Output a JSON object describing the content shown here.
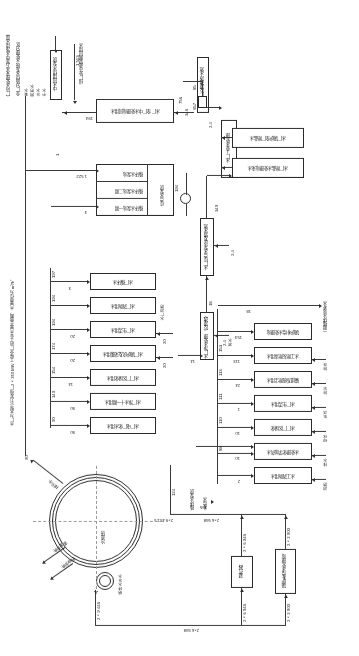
{
  "diagram": {
    "note_right": "水厂为大型火力发电厂2×350 MW 工程全厂的工业水量平衡图，水量单位为 m³/h。",
    "note_bottom_left": "全厂分质供水系统 水处理分区",
    "note_bottom_right": "（厂内水处理来水方案中水净用水量）"
  },
  "top": {
    "boxes": [
      {
        "id": "demin",
        "label": "锅炉补给水处理站",
        "x": 63,
        "y": 62,
        "w": 21,
        "h": 45
      },
      {
        "id": "cond",
        "label": "凝汽器",
        "x": 106,
        "y": 68,
        "w": 22,
        "h": 32
      }
    ],
    "flow_labels": [
      {
        "text": "2×2 900",
        "x": 70,
        "y": 30
      },
      {
        "text": "2×2 900",
        "x": 70,
        "y": 118
      },
      {
        "text": "2×6 948",
        "x": 113,
        "y": 32
      },
      {
        "text": "2×6 948",
        "x": 113,
        "y": 113
      },
      {
        "text": "2×6 948",
        "x": 160,
        "y": 42
      },
      {
        "text": "2×6 948",
        "x": 160,
        "y": 141
      },
      {
        "text": "2×9 451.5",
        "x": 185,
        "y": 135
      },
      {
        "text": "2×9 448",
        "x": 248,
        "y": 46
      },
      {
        "text": "105",
        "x": 160,
        "y": 146
      },
      {
        "text": "124",
        "x": 178,
        "y": 168
      }
    ],
    "side_labels": [
      {
        "text": "循环水泵房",
        "x": 163,
        "y": 150
      },
      {
        "text": "补给水",
        "x": 148,
        "y": 152
      },
      {
        "text": "循环水补水",
        "x": 234,
        "y": 70
      },
      {
        "text": "冷却塔",
        "x": 256,
        "y": 122
      },
      {
        "text": "风吹损失",
        "x": 286,
        "y": 86
      },
      {
        "text": "蒸发损失",
        "x": 299,
        "y": 95
      },
      {
        "text": "排污水",
        "x": 316,
        "y": 168
      },
      {
        "text": "90",
        "x": 314,
        "y": 175
      }
    ]
  },
  "left_column": {
    "boxes": [
      {
        "label": "水工消防用水",
        "qty": "2",
        "tap": "消防",
        "tapqty": "2",
        "x": 47,
        "y": 172,
        "w": 58,
        "h": 17
      },
      {
        "label": "水处理化学加药水",
        "qty": "10",
        "tap": "排水",
        "tapqty": "10",
        "x": 47,
        "y": 196,
        "w": 58,
        "h": 17
      },
      {
        "label": "水厂厂区绿化",
        "qty": "10",
        "tap": "绿化",
        "tapqty": "10",
        "x": 47,
        "y": 220,
        "w": 58,
        "h": 17
      },
      {
        "label": "水厂生活用水",
        "qty": "1",
        "tap": "生活",
        "tapqty": "1",
        "x": 47,
        "y": 244,
        "w": 58,
        "h": 17
      },
      {
        "label": "输煤系统除尘用水",
        "qty": "24",
        "tap": "除尘",
        "tapqty": "24",
        "x": 47,
        "y": 268,
        "w": 58,
        "h": 17
      },
      {
        "label": "水工除灰除渣用水",
        "qty": "113",
        "tap": "除灰",
        "tapqty": "113",
        "x": 47,
        "y": 292,
        "w": 58,
        "h": 17
      },
      {
        "label": "锅炉补给水处理站",
        "qty": "153",
        "tap": "",
        "tapqty": "",
        "x": 47,
        "y": 316,
        "w": 58,
        "h": 17
      }
    ],
    "riser_values": [
      "2",
      "10",
      "88",
      "110",
      "111",
      "113",
      "153",
      "18"
    ],
    "side_labels": [
      {
        "text": "一期循环水站补水",
        "x": 36,
        "y": 330
      },
      {
        "text": "18",
        "x": 108,
        "y": 352
      }
    ]
  },
  "mid": {
    "boxes": [
      {
        "label": "水厂净水处理（反渗透）",
        "x": 145,
        "y": 296,
        "w": 14,
        "h": 46
      },
      {
        "label": "水厂综合水泵房及清水池",
        "x": 145,
        "y": 380,
        "w": 14,
        "h": 58
      },
      {
        "label": "水厂工业水处理",
        "x": 122,
        "y": 480,
        "w": 16,
        "h": 58
      },
      {
        "label": "水厂反渗透浓水池",
        "x": 150,
        "y": 543,
        "w": 12,
        "h": 56
      }
    ],
    "labels": [
      {
        "text": "14",
        "x": 169,
        "y": 294
      },
      {
        "text": "2.4",
        "x": 136,
        "y": 318
      },
      {
        "text": "浓水",
        "x": 129,
        "y": 316
      },
      {
        "text": "18",
        "x": 164,
        "y": 354
      },
      {
        "text": "2.4",
        "x": 122,
        "y": 412
      },
      {
        "text": "349",
        "x": 139,
        "y": 448
      },
      {
        "text": "2.4",
        "x": 178,
        "y": 440
      },
      {
        "text": "346",
        "x": 148,
        "y": 533
      },
      {
        "text": "756",
        "x": 172,
        "y": 546
      },
      {
        "text": "657",
        "x": 176,
        "y": 558
      },
      {
        "text": "85",
        "x": 158,
        "y": 552
      },
      {
        "text": "85",
        "x": 160,
        "y": 570
      },
      {
        "text": "267",
        "x": 186,
        "y": 470
      },
      {
        "text": "1 020",
        "x": 262,
        "y": 545
      },
      {
        "text": "405",
        "x": 300,
        "y": 520
      },
      {
        "text": "194",
        "x": 274,
        "y": 490
      },
      {
        "text": "1",
        "x": 262,
        "y": 500
      },
      {
        "text": "3",
        "x": 278,
        "y": 600
      },
      {
        "text": "1 522",
        "x": 302,
        "y": 610
      },
      {
        "text": "1 513",
        "x": 302,
        "y": 565
      }
    ]
  },
  "right_column": {
    "boxes": [
      {
        "label": "水厂电厂化水用水",
        "qty": "90",
        "cum": "90",
        "x": 203,
        "y": 222,
        "w": 66,
        "h": 17
      },
      {
        "label": "水厂净水十一期用水",
        "qty": "90",
        "cum": "140",
        "x": 203,
        "y": 246,
        "w": 66,
        "h": 17
      },
      {
        "label": "水厂厂区绿化用水",
        "qty": "14",
        "cum": "154",
        "x": 203,
        "y": 270,
        "w": 66,
        "h": 17
      },
      {
        "label": "水厂锅炉房及采暖用水",
        "qty": "20",
        "cum": "174",
        "x": 203,
        "y": 294,
        "w": 66,
        "h": 17
      },
      {
        "label": "水厂生活用水",
        "qty": "20",
        "cum": "194",
        "x": 203,
        "y": 318,
        "w": 66,
        "h": 17
      },
      {
        "label": "水厂消防用水",
        "qty": "",
        "cum": "194",
        "x": 203,
        "y": 342,
        "w": 66,
        "h": 17
      },
      {
        "label": "水厂循环水",
        "qty": "3",
        "cum": "197",
        "x": 203,
        "y": 366,
        "w": 66,
        "h": 17
      }
    ],
    "side_taps": [
      {
        "text": "水厂消防",
        "x": 196,
        "y": 340
      },
      {
        "text": "20",
        "x": 193,
        "y": 296
      },
      {
        "text": "20",
        "x": 193,
        "y": 320
      }
    ]
  },
  "bottom": {
    "boxes": [
      {
        "label": "水厂除盐水处理站来水",
        "x": 55,
        "y": 478,
        "w": 72,
        "h": 20
      },
      {
        "label": "水厂锅炉全厂除盐水",
        "x": 55,
        "y": 508,
        "w": 72,
        "h": 20
      },
      {
        "label": "水厂全厂中水处理站回用水",
        "x": 185,
        "y": 533,
        "w": 72,
        "h": 24
      },
      {
        "label": "中水回用供水泵房",
        "x": 297,
        "y": 560,
        "w": 12,
        "h": 46
      }
    ],
    "group": {
      "title": "综合\n水泵房",
      "rows": [
        {
          "label": "循环水泵站一期",
          "qty": "194"
        },
        {
          "label": "循环水泵站二期",
          "qty": ""
        },
        {
          "label": "循环水泵站",
          "qty": "1"
        }
      ],
      "x": 185,
      "y": 440,
      "w": 78,
      "h": 52
    },
    "labels": [
      {
        "text": "排厂外市政管网回用水",
        "x": 276,
        "y": 585
      },
      {
        "text": "全厂分质供水处理",
        "x": 305,
        "y": 592
      },
      {
        "text": "中水",
        "x": 312,
        "y": 560
      },
      {
        "text": "补水",
        "x": 312,
        "y": 572
      },
      {
        "text": "回用水",
        "x": 312,
        "y": 584
      },
      {
        "text": "来水",
        "x": 312,
        "y": 596
      }
    ]
  },
  "symbols": {
    "valve": "Ⓕ",
    "pump": "◎"
  }
}
